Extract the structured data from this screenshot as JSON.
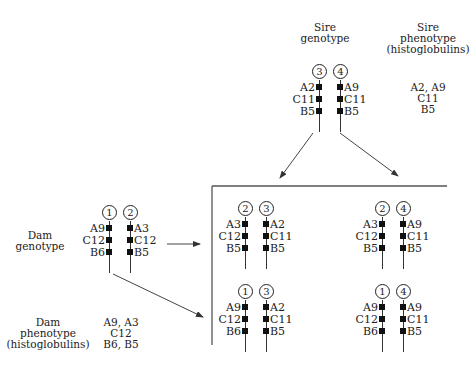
{
  "sire": {
    "genotype_label": [
      "Sire",
      "genotype"
    ],
    "phenotype_label": [
      "Sire",
      "phenotype",
      "(histoglobulins)"
    ],
    "phenotype_values": [
      "A2, A9",
      "C11",
      "B5"
    ],
    "chromosomes": [
      {
        "id": "3",
        "genes": [
          "A2",
          "C11",
          "B5"
        ],
        "side": "left"
      },
      {
        "id": "4",
        "genes": [
          "A9",
          "C11",
          "B5"
        ],
        "side": "right"
      }
    ]
  },
  "dam": {
    "genotype_label": [
      "Dam",
      "genotype"
    ],
    "phenotype_label": [
      "Dam",
      "phenotype",
      "(histoglobulins)"
    ],
    "phenotype_values": [
      "A9, A3",
      "C12",
      "B6, B5"
    ],
    "chromosomes": [
      {
        "id": "1",
        "genes": [
          "A9",
          "C12",
          "B6"
        ],
        "side": "left"
      },
      {
        "id": "2",
        "genes": [
          "A3",
          "C12",
          "B5"
        ],
        "side": "right"
      }
    ]
  },
  "offspring": [
    {
      "pair": [
        "2",
        "3"
      ],
      "left": [
        "A3",
        "C12",
        "B5"
      ],
      "right": [
        "A2",
        "C11",
        "B5"
      ]
    },
    {
      "pair": [
        "2",
        "4"
      ],
      "left": [
        "A3",
        "C12",
        "B5"
      ],
      "right": [
        "A9",
        "C11",
        "B5"
      ]
    },
    {
      "pair": [
        "1",
        "3"
      ],
      "left": [
        "A9",
        "C12",
        "B6"
      ],
      "right": [
        "A2",
        "C11",
        "B5"
      ]
    },
    {
      "pair": [
        "1",
        "4"
      ],
      "left": [
        "A9",
        "C12",
        "B6"
      ],
      "right": [
        "A9",
        "C11",
        "B5"
      ]
    }
  ]
}
